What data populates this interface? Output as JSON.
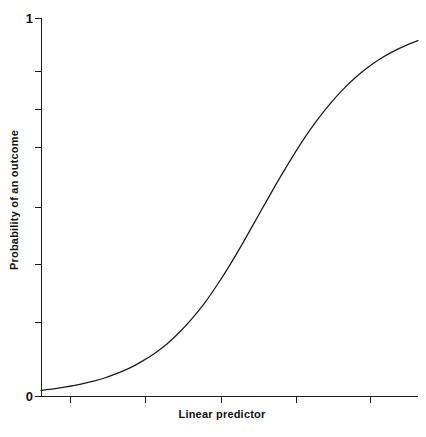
{
  "chart_data": {
    "type": "line",
    "title": "",
    "xlabel": "Linear predictor",
    "ylabel": "Probability of an outcome",
    "xlim": [
      -6,
      6
    ],
    "ylim": [
      0,
      1
    ],
    "grid": false,
    "legend": null,
    "x_tick_labels": [
      "",
      "",
      "",
      "",
      ""
    ],
    "y_tick_labels": [
      "1",
      "",
      "",
      "",
      "",
      "",
      "0"
    ],
    "y_tick_values": [
      1,
      0.8333,
      0.6667,
      0.5,
      0.3333,
      0.1667,
      0
    ],
    "y_axis_max_label": "1",
    "y_axis_min_label": "0",
    "series": [
      {
        "name": "logistic",
        "x": [
          -6.0,
          -5.6,
          -5.2,
          -4.8,
          -4.4,
          -4.0,
          -3.6,
          -3.2,
          -2.8,
          -2.4,
          -2.0,
          -1.6,
          -1.2,
          -0.8,
          -0.4,
          0.0,
          0.4,
          0.8,
          1.2,
          1.6,
          2.0,
          2.4,
          2.8,
          3.2,
          3.6,
          4.0,
          4.4,
          4.8,
          5.2,
          5.6,
          6.0
        ],
        "y": [
          0.015,
          0.019,
          0.024,
          0.03,
          0.038,
          0.047,
          0.059,
          0.073,
          0.091,
          0.112,
          0.137,
          0.168,
          0.204,
          0.245,
          0.293,
          0.345,
          0.401,
          0.46,
          0.519,
          0.577,
          0.632,
          0.684,
          0.731,
          0.773,
          0.81,
          0.842,
          0.869,
          0.892,
          0.911,
          0.927,
          0.94
        ]
      }
    ]
  },
  "axes": {
    "y_top_label": "1",
    "y_bottom_label": "0",
    "x_title": "Linear predictor",
    "y_title": "Probability of an outcome"
  }
}
